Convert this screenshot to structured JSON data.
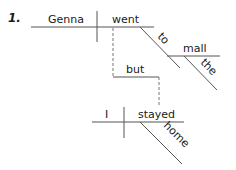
{
  "diagram": {
    "type": "sentence-diagram",
    "item_number": "1.",
    "sentence": "Genna went to the mall but I stayed home",
    "clause1": {
      "subject": "Genna",
      "verb": "went",
      "preposition": "to",
      "object": "mall",
      "modifier": "the"
    },
    "conjunction": "but",
    "clause2": {
      "subject": "I",
      "verb": "stayed",
      "adverb": "home"
    },
    "line_color": "#555555",
    "text_color": "#1a1a1a"
  }
}
